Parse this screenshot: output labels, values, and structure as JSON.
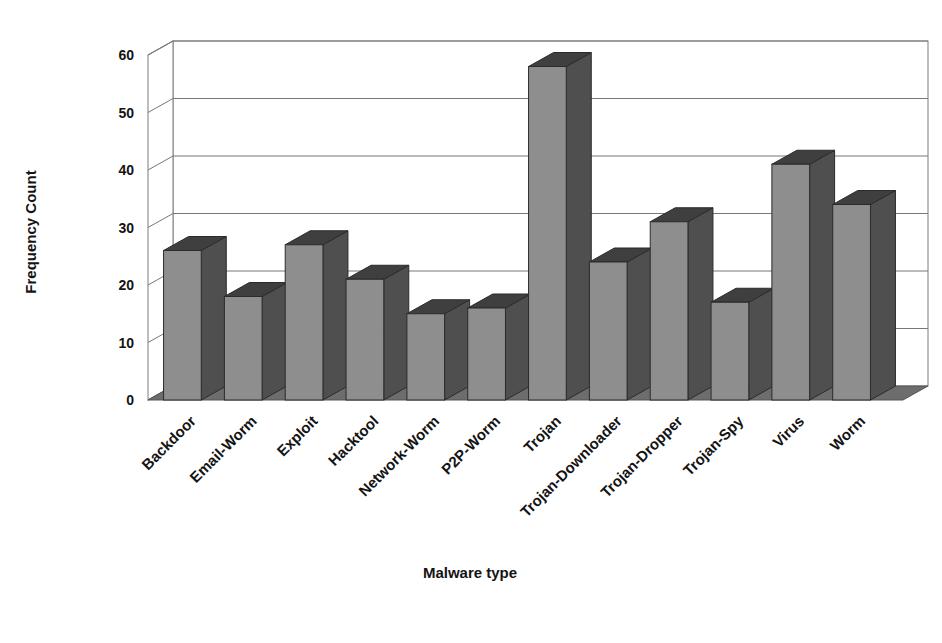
{
  "chart_data": {
    "type": "bar",
    "title": "",
    "subtitle": "",
    "xlabel": "Malware type",
    "ylabel": "Frequency Count",
    "categories": [
      "Backdoor",
      "Email-Worm",
      "Exploit",
      "Hacktool",
      "Network-Worm",
      "P2P-Worm",
      "Trojan",
      "Trojan-Downloader",
      "Trojan-Dropper",
      "Trojan-Spy",
      "Virus",
      "Worm"
    ],
    "values": [
      26,
      18,
      27,
      21,
      15,
      16,
      58,
      24,
      31,
      17,
      41,
      34
    ],
    "ylim": [
      0,
      60
    ],
    "ytick_labels": [
      "0",
      "10",
      "20",
      "30",
      "40",
      "50",
      "60"
    ],
    "ytick_values": [
      0,
      10,
      20,
      30,
      40,
      50,
      60
    ],
    "grid": true,
    "grid_axis": "y",
    "legend": false,
    "legend_position": "none",
    "style": "3d-column",
    "tick_label_rotation_deg": -45,
    "series": [
      {
        "name": "Frequency Count",
        "values": [
          26,
          18,
          27,
          21,
          15,
          16,
          58,
          24,
          31,
          17,
          41,
          34
        ]
      }
    ]
  },
  "colors": {
    "page_background": "#ffffff",
    "plot_background": "#ffffff",
    "bar_front": "#8e8e8e",
    "bar_side": "#4f4f4f",
    "bar_top": "#3f3f3f",
    "bar_outline": "#2b2b2b",
    "floor": "#6d6d6d",
    "gridline": "#777777",
    "axis_line": "#555555",
    "wall_line": "#888888",
    "text": "#141414"
  }
}
